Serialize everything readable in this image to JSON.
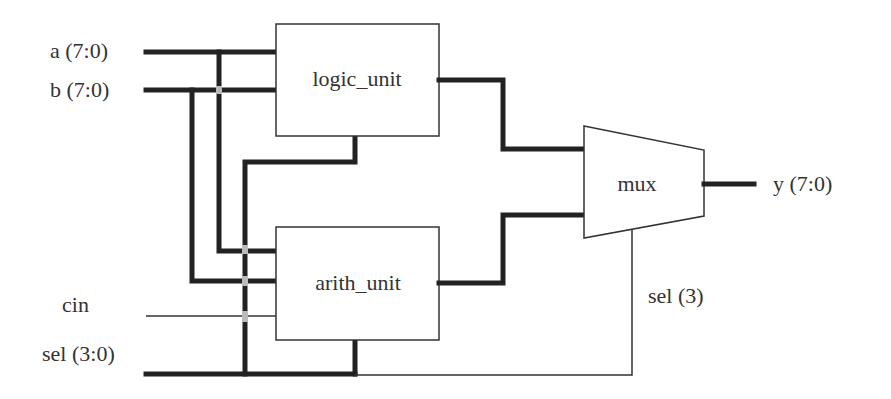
{
  "diagram": {
    "type": "block-diagram",
    "inputs": {
      "a": "a (7:0)",
      "b": "b (7:0)",
      "cin": "cin",
      "sel": "sel (3:0)"
    },
    "outputs": {
      "y": "y (7:0)"
    },
    "blocks": {
      "logic_unit": "logic_unit",
      "arith_unit": "arith_unit",
      "mux": "mux"
    },
    "signal_labels": {
      "mux_select": "sel (3)"
    },
    "connections": [
      {
        "from": "a",
        "to": "logic_unit",
        "kind": "bus"
      },
      {
        "from": "b",
        "to": "logic_unit",
        "kind": "bus"
      },
      {
        "from": "a",
        "to": "arith_unit",
        "kind": "bus"
      },
      {
        "from": "b",
        "to": "arith_unit",
        "kind": "bus"
      },
      {
        "from": "cin",
        "to": "arith_unit",
        "kind": "wire"
      },
      {
        "from": "sel",
        "to": "logic_unit",
        "kind": "bus"
      },
      {
        "from": "sel",
        "to": "arith_unit",
        "kind": "bus"
      },
      {
        "from": "sel",
        "to": "mux",
        "kind": "wire",
        "label": "sel (3)"
      },
      {
        "from": "logic_unit",
        "to": "mux",
        "kind": "bus"
      },
      {
        "from": "arith_unit",
        "to": "mux",
        "kind": "bus"
      },
      {
        "from": "mux",
        "to": "y",
        "kind": "bus"
      }
    ],
    "colors": {
      "wire": "#222222",
      "crossing": "#bbbbbb",
      "text": "#333333"
    }
  }
}
